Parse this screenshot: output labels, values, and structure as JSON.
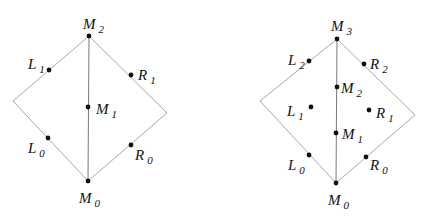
{
  "diagrams": [
    {
      "name": "left-diamond",
      "outline": [
        [
          89,
          36
        ],
        [
          13,
          101
        ],
        [
          88,
          181
        ],
        [
          167,
          113
        ]
      ],
      "spine": [
        [
          89,
          36
        ],
        [
          88,
          181
        ]
      ],
      "points": [
        {
          "id": "M2",
          "base": "M",
          "sub": "2",
          "x": 89,
          "y": 36,
          "lx": 83,
          "ly": 29,
          "anchor": "start"
        },
        {
          "id": "L1",
          "base": "L",
          "sub": "1",
          "x": 49,
          "y": 70,
          "lx": 28,
          "ly": 69,
          "anchor": "start"
        },
        {
          "id": "R1",
          "base": "R",
          "sub": "1",
          "x": 131,
          "y": 75,
          "lx": 138,
          "ly": 80,
          "anchor": "start"
        },
        {
          "id": "M1",
          "base": "M",
          "sub": "1",
          "x": 88,
          "y": 107,
          "lx": 96,
          "ly": 114,
          "anchor": "start"
        },
        {
          "id": "L0",
          "base": "L",
          "sub": "0",
          "x": 48,
          "y": 138,
          "lx": 28,
          "ly": 153,
          "anchor": "start"
        },
        {
          "id": "R0",
          "base": "R",
          "sub": "0",
          "x": 131,
          "y": 145,
          "lx": 135,
          "ly": 160,
          "anchor": "start"
        },
        {
          "id": "M0",
          "base": "M",
          "sub": "0",
          "x": 88,
          "y": 181,
          "lx": 79,
          "ly": 203,
          "anchor": "start"
        }
      ]
    },
    {
      "name": "right-diamond",
      "outline": [
        [
          337,
          39
        ],
        [
          260,
          101
        ],
        [
          336,
          183
        ],
        [
          415,
          115
        ]
      ],
      "spine": [
        [
          337,
          39
        ],
        [
          336,
          183
        ]
      ],
      "points": [
        {
          "id": "M3",
          "base": "M",
          "sub": "3",
          "x": 337,
          "y": 39,
          "lx": 331,
          "ly": 31,
          "anchor": "start"
        },
        {
          "id": "L2",
          "base": "L",
          "sub": "2",
          "x": 309,
          "y": 61,
          "lx": 288,
          "ly": 65,
          "anchor": "start"
        },
        {
          "id": "R2",
          "base": "R",
          "sub": "2",
          "x": 364,
          "y": 64,
          "lx": 370,
          "ly": 69,
          "anchor": "start"
        },
        {
          "id": "M2",
          "base": "M",
          "sub": "2",
          "x": 337,
          "y": 87,
          "lx": 341,
          "ly": 93,
          "anchor": "start"
        },
        {
          "id": "L1",
          "base": "L",
          "sub": "1",
          "x": 311,
          "y": 107,
          "lx": 287,
          "ly": 116,
          "anchor": "start"
        },
        {
          "id": "R1",
          "base": "R",
          "sub": "1",
          "x": 369,
          "y": 110,
          "lx": 376,
          "ly": 118,
          "anchor": "start"
        },
        {
          "id": "M1",
          "base": "M",
          "sub": "1",
          "x": 336,
          "y": 133,
          "lx": 342,
          "ly": 139,
          "anchor": "start"
        },
        {
          "id": "L0",
          "base": "L",
          "sub": "0",
          "x": 309,
          "y": 155,
          "lx": 288,
          "ly": 170,
          "anchor": "start"
        },
        {
          "id": "R0",
          "base": "R",
          "sub": "0",
          "x": 366,
          "y": 157,
          "lx": 370,
          "ly": 170,
          "anchor": "start"
        },
        {
          "id": "M0",
          "base": "M",
          "sub": "0",
          "x": 336,
          "y": 183,
          "lx": 328,
          "ly": 205,
          "anchor": "start"
        }
      ]
    }
  ]
}
